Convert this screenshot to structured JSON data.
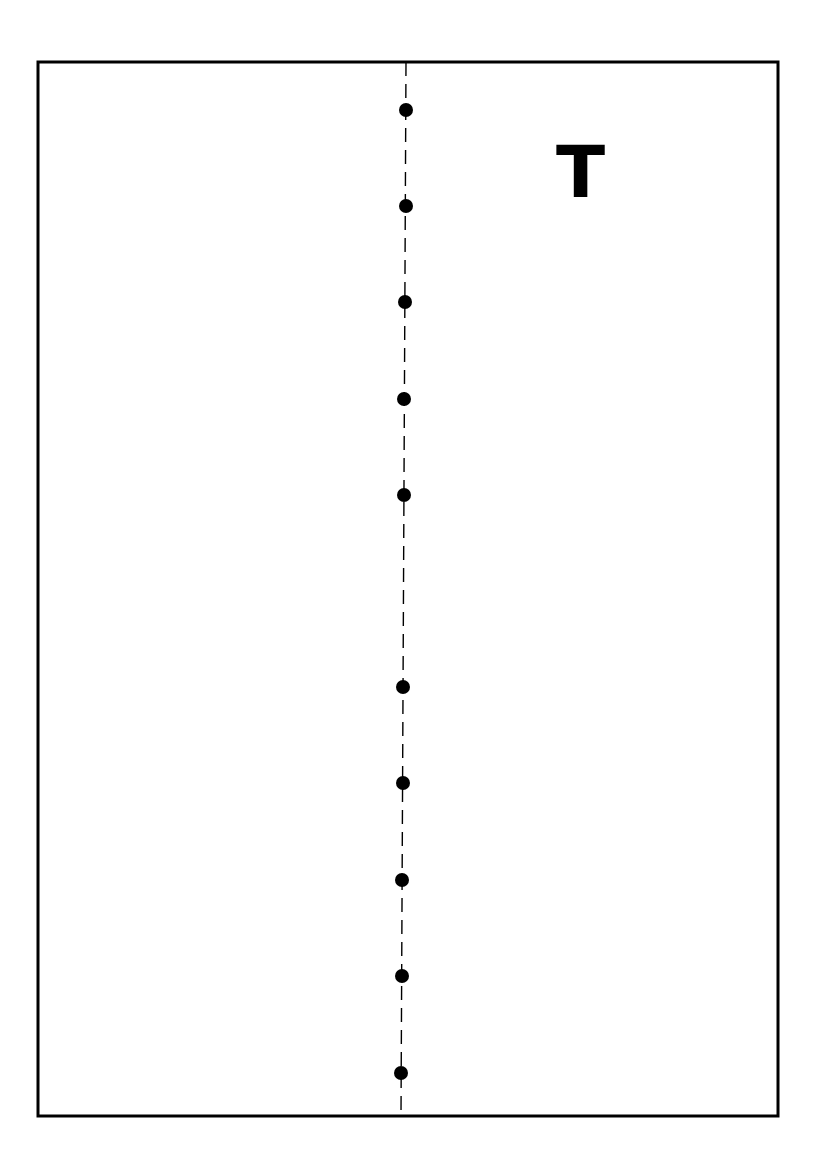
{
  "diagram": {
    "label": "T",
    "colors": {
      "stroke": "#000000",
      "dot": "#000000",
      "background": "#ffffff"
    },
    "frame": {
      "x": 38,
      "y": 62,
      "width": 740,
      "height": 1054,
      "stroke_width": 3
    },
    "center_line": {
      "style": "dashed",
      "x_top": 406,
      "y_top": 62,
      "x_bottom": 401,
      "y_bottom": 1116,
      "dash": [
        14,
        8
      ],
      "stroke_width": 1.4
    },
    "dot_radius": 7,
    "dots": [
      {
        "x": 406,
        "y": 110
      },
      {
        "x": 406,
        "y": 206
      },
      {
        "x": 405,
        "y": 302
      },
      {
        "x": 404,
        "y": 399
      },
      {
        "x": 404,
        "y": 495
      },
      {
        "x": 403,
        "y": 687
      },
      {
        "x": 403,
        "y": 783
      },
      {
        "x": 402,
        "y": 880
      },
      {
        "x": 402,
        "y": 976
      },
      {
        "x": 401,
        "y": 1073
      }
    ]
  }
}
